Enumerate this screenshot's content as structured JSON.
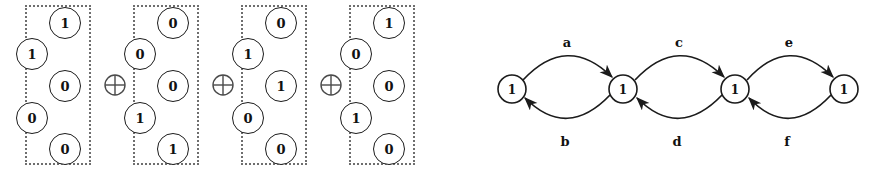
{
  "figure": {
    "ink_color": "#1b1b1b",
    "dotted_border_color": "#6e6e6e",
    "background_color": "#ffffff"
  },
  "xor_expression": {
    "operator_symbol": "⊕",
    "operator_name": "xor-operator",
    "operator_count": 3,
    "vector_length": 5,
    "vectors": [
      {
        "index": 1,
        "bits": [
          "1",
          "1",
          "0",
          "0",
          "0"
        ],
        "sides": [
          "right",
          "left",
          "right",
          "left",
          "right"
        ]
      },
      {
        "index": 2,
        "bits": [
          "0",
          "0",
          "0",
          "1",
          "1"
        ],
        "sides": [
          "right",
          "left",
          "right",
          "left",
          "right"
        ]
      },
      {
        "index": 3,
        "bits": [
          "0",
          "1",
          "1",
          "0",
          "0"
        ],
        "sides": [
          "right",
          "left",
          "right",
          "left",
          "right"
        ]
      },
      {
        "index": 4,
        "bits": [
          "1",
          "0",
          "0",
          "1",
          "0"
        ],
        "sides": [
          "right",
          "left",
          "right",
          "left",
          "right"
        ]
      }
    ]
  },
  "chain_graph": {
    "nodes": [
      {
        "id": "n1",
        "label": "1"
      },
      {
        "id": "n2",
        "label": "1"
      },
      {
        "id": "n3",
        "label": "1"
      },
      {
        "id": "n4",
        "label": "1"
      }
    ],
    "edges": [
      {
        "label": "a",
        "from": "n1",
        "to": "n2",
        "direction": "forward",
        "position": "above"
      },
      {
        "label": "b",
        "from": "n2",
        "to": "n1",
        "direction": "backward",
        "position": "below"
      },
      {
        "label": "c",
        "from": "n2",
        "to": "n3",
        "direction": "forward",
        "position": "above"
      },
      {
        "label": "d",
        "from": "n3",
        "to": "n2",
        "direction": "backward",
        "position": "below"
      },
      {
        "label": "e",
        "from": "n3",
        "to": "n4",
        "direction": "forward",
        "position": "above"
      },
      {
        "label": "f",
        "from": "n4",
        "to": "n3",
        "direction": "backward",
        "position": "below"
      }
    ]
  }
}
